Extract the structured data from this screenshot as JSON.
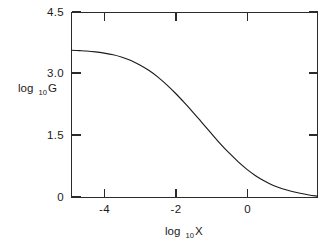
{
  "chart_data": {
    "type": "line",
    "title": "",
    "subtitle": "",
    "xlabel": "log10 X",
    "xlabel_base": "log",
    "xlabel_sub": "10",
    "xlabel_var": "X",
    "ylabel": "log10 G",
    "ylabel_base": "log",
    "ylabel_sub": "10",
    "ylabel_var": "G",
    "xlim": [
      -4.92,
      1.99
    ],
    "ylim": [
      0.0,
      4.5
    ],
    "xticks": [
      -4,
      -2,
      0
    ],
    "xtick_labels": [
      "-4",
      "-2",
      "0"
    ],
    "yticks": [
      0,
      1.5,
      3.0,
      4.5
    ],
    "ytick_labels": [
      "0",
      "1.5",
      "3.0",
      "4.5"
    ],
    "grid": false,
    "legend": false,
    "legend_position": "none",
    "frame": "box",
    "tick_direction": "in",
    "series": [
      {
        "name": "log10 G vs log10 X",
        "x": [
          -4.92,
          -4.7,
          -4.5,
          -4.25,
          -4.0,
          -3.75,
          -3.5,
          -3.25,
          -3.0,
          -2.75,
          -2.5,
          -2.25,
          -2.0,
          -1.75,
          -1.5,
          -1.25,
          -1.0,
          -0.75,
          -0.5,
          -0.25,
          0.0,
          0.25,
          0.5,
          0.75,
          1.0,
          1.25,
          1.5,
          1.75,
          1.99
        ],
        "y": [
          3.58,
          3.57,
          3.56,
          3.54,
          3.51,
          3.47,
          3.41,
          3.33,
          3.22,
          3.09,
          2.93,
          2.74,
          2.53,
          2.3,
          2.06,
          1.81,
          1.56,
          1.31,
          1.08,
          0.87,
          0.68,
          0.52,
          0.39,
          0.28,
          0.2,
          0.14,
          0.09,
          0.05,
          0.02
        ]
      }
    ],
    "curve_endpoints": {
      "left": {
        "x": -4.92,
        "y": 3.58
      },
      "right": {
        "x": 1.99,
        "y": 0.02
      }
    },
    "annotations": []
  },
  "figure": {
    "background_color": "#ffffff",
    "line_color": "#1b1b1b",
    "axis_color": "#2b2b2b",
    "text_color": "#1a1a1a"
  }
}
